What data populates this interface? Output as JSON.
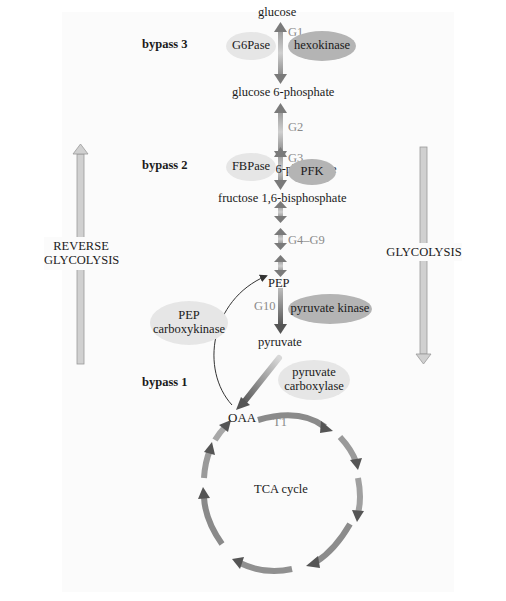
{
  "diagram": {
    "type": "metabolic-pathway",
    "metabolites": {
      "glucose": "glucose",
      "g6p": "glucose 6-phosphate",
      "f6p": "fructose 6-phosphate",
      "f16bp": "fructose 1,6-bisphosphate",
      "pep": "PEP",
      "pyruvate": "pyruvate",
      "oaa": "OAA"
    },
    "steps": {
      "g1": "G1",
      "g2": "G2",
      "g3": "G3",
      "g4_g9": "G4–G9",
      "g10": "G10",
      "t1": "T1"
    },
    "enzymes": {
      "g6pase": "G6Pase",
      "hexokinase": "hexokinase",
      "fbpase": "FBPase",
      "pfk": "PFK",
      "pyruvate_kinase": "pyruvate kinase",
      "pepck_line1": "PEP",
      "pepck_line2": "carboxykinase",
      "pc_line1": "pyruvate",
      "pc_line2": "carboxylase"
    },
    "bypasses": {
      "bypass3": "bypass 3",
      "bypass2": "bypass 2",
      "bypass1": "bypass 1"
    },
    "directions": {
      "reverse_line1": "REVERSE",
      "reverse_line2": "GLYCOLYSIS",
      "forward": "GLYCOLYSIS"
    },
    "cycle": {
      "label": "TCA cycle"
    },
    "colors": {
      "light_enzyme": "#e6e6e6",
      "dark_enzyme": "#b4b4b4",
      "arrow_dark": "#6e6e6e",
      "arrow_light": "#c8c8c8",
      "step_label": "#8a8a8a"
    }
  }
}
